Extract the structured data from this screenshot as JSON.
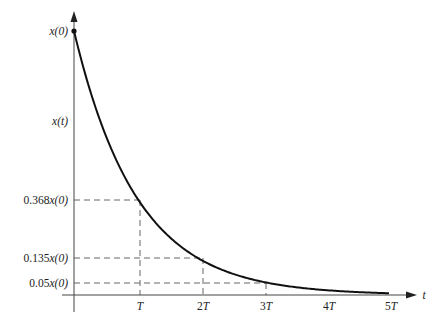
{
  "chart_data": {
    "type": "line",
    "title": "",
    "xlabel": "t",
    "ylabel": "x(t)",
    "function": "x(t) = x(0) * exp(-t/T)",
    "x_ticks": [
      "T",
      "2T",
      "3T",
      "4T",
      "5T"
    ],
    "x_tick_values": [
      1,
      2,
      3,
      4,
      5
    ],
    "y_ticks": [
      "x(0)",
      "0.368x(0)",
      "0.135x(0)",
      "0.05x(0)"
    ],
    "y_tick_values": [
      1.0,
      0.368,
      0.135,
      0.05
    ],
    "series": [
      {
        "name": "x(t)",
        "x": [
          0,
          0.5,
          1,
          1.5,
          2,
          2.5,
          3,
          3.5,
          4,
          4.5,
          5
        ],
        "values": [
          1.0,
          0.607,
          0.368,
          0.223,
          0.135,
          0.082,
          0.05,
          0.03,
          0.018,
          0.011,
          0.007
        ]
      }
    ],
    "reference_lines": [
      {
        "label": "0.368x(0)",
        "t": 1,
        "value": 0.368
      },
      {
        "label": "0.135x(0)",
        "t": 2,
        "value": 0.135
      },
      {
        "label": "0.05x(0)",
        "t": 3,
        "value": 0.05
      }
    ],
    "xlim": [
      0,
      5
    ],
    "ylim": [
      0,
      1
    ],
    "grid": false,
    "legend": "none"
  },
  "labels": {
    "x0": "x(0)",
    "xt": "x(t)",
    "y368": "0.368",
    "y135": "0.135",
    "y05": "0.05",
    "suffix": "x(0)",
    "t": "t",
    "T1": "T",
    "T2": "2",
    "T3": "3",
    "T4": "4",
    "T5": "5",
    "Tsym": "T"
  }
}
